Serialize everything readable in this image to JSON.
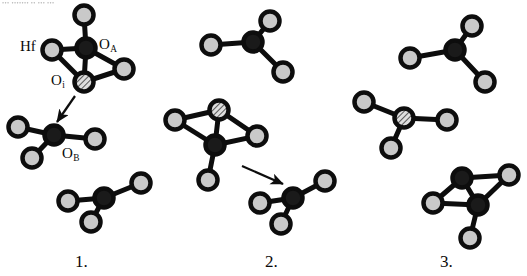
{
  "figure": {
    "top_cut_text": "••• ••••••• •• ••• •••",
    "background": "#ffffff",
    "atom_colors": {
      "ring": "#0d0d0d",
      "hafnium_fill": "#1a1a1a",
      "oxygen_fill": "#c9c9c9",
      "interstitial_hatch_fill": "#d7d7d7",
      "bond": "#0d0d0d"
    }
  },
  "labels": {
    "hf": {
      "text": "Hf",
      "sub": ""
    },
    "o_a": {
      "text": "O",
      "sub": "A"
    },
    "o_i": {
      "text": "O",
      "sub": "i"
    },
    "o_b": {
      "text": "O",
      "sub": "B"
    }
  },
  "panels": [
    {
      "id": "panel-1",
      "number": "1."
    },
    {
      "id": "panel-2",
      "number": "2."
    },
    {
      "id": "panel-3",
      "number": "3."
    }
  ],
  "chart_data": {
    "type": "diagram",
    "legend": [
      {
        "symbol": "dark-filled-circle",
        "name": "Hf",
        "fill": "#1a1a1a"
      },
      {
        "symbol": "light-filled-circle",
        "name": "O",
        "fill": "#c9c9c9"
      },
      {
        "symbol": "hatched-circle",
        "name": "O interstitial",
        "fill": "hatched"
      }
    ],
    "atom_radius_px": 9.5,
    "ring_width_px": 4.5,
    "bond_width_px": 5,
    "clusters": [
      {
        "panel": "1",
        "name": "panel1-upper-cluster",
        "atoms": [
          {
            "id": "p1a-hf-center",
            "type": "Hf",
            "x": 86,
            "y": 48
          },
          {
            "id": "p1a-o-top",
            "type": "O",
            "x": 84,
            "y": 15
          },
          {
            "id": "p1a-o-left",
            "type": "O",
            "x": 52,
            "y": 50
          },
          {
            "id": "p1a-o-right",
            "type": "O",
            "x": 124,
            "y": 69
          },
          {
            "id": "p1a-oi",
            "type": "Oi",
            "x": 84,
            "y": 82
          }
        ],
        "bonds": [
          [
            "p1a-hf-center",
            "p1a-o-top"
          ],
          [
            "p1a-hf-center",
            "p1a-o-left"
          ],
          [
            "p1a-hf-center",
            "p1a-o-right"
          ],
          [
            "p1a-hf-center",
            "p1a-oi"
          ],
          [
            "p1a-o-left",
            "p1a-oi"
          ],
          [
            "p1a-oi",
            "p1a-o-right"
          ]
        ],
        "labels": [
          {
            "ref": "hf",
            "x": 20,
            "y": 38
          },
          {
            "ref": "o_a",
            "x": 99,
            "y": 36
          },
          {
            "ref": "o_i",
            "x": 51,
            "y": 72
          }
        ]
      },
      {
        "panel": "1",
        "name": "panel1-lower-left-cluster",
        "atoms": [
          {
            "id": "p1b-hf",
            "type": "Hf",
            "x": 54,
            "y": 135
          },
          {
            "id": "p1b-o-left",
            "type": "O",
            "x": 18,
            "y": 127
          },
          {
            "id": "p1b-o-right",
            "type": "O",
            "x": 95,
            "y": 139
          },
          {
            "id": "p1b-o-down",
            "type": "O",
            "x": 32,
            "y": 158
          }
        ],
        "bonds": [
          [
            "p1b-hf",
            "p1b-o-left"
          ],
          [
            "p1b-hf",
            "p1b-o-right"
          ],
          [
            "p1b-hf",
            "p1b-o-down"
          ]
        ],
        "labels": [
          {
            "ref": "o_b",
            "x": 62,
            "y": 145
          }
        ]
      },
      {
        "panel": "1",
        "name": "panel1-lower-right-cluster",
        "atoms": [
          {
            "id": "p1c-hf",
            "type": "Hf",
            "x": 104,
            "y": 198
          },
          {
            "id": "p1c-o-left",
            "type": "O",
            "x": 68,
            "y": 201
          },
          {
            "id": "p1c-o-upper",
            "type": "O",
            "x": 141,
            "y": 183
          },
          {
            "id": "p1c-o-down",
            "type": "O",
            "x": 91,
            "y": 222
          }
        ],
        "bonds": [
          [
            "p1c-hf",
            "p1c-o-left"
          ],
          [
            "p1c-hf",
            "p1c-o-upper"
          ],
          [
            "p1c-hf",
            "p1c-o-down"
          ]
        ],
        "labels": []
      },
      {
        "panel": "2",
        "name": "panel2-upper-cluster",
        "atoms": [
          {
            "id": "p2a-hf",
            "type": "Hf",
            "x": 253,
            "y": 42
          },
          {
            "id": "p2a-o-left",
            "type": "O",
            "x": 211,
            "y": 45
          },
          {
            "id": "p2a-o-top",
            "type": "O",
            "x": 270,
            "y": 21
          },
          {
            "id": "p2a-o-down",
            "type": "O",
            "x": 283,
            "y": 72
          }
        ],
        "bonds": [
          [
            "p2a-hf",
            "p2a-o-left"
          ],
          [
            "p2a-hf",
            "p2a-o-top"
          ],
          [
            "p2a-hf",
            "p2a-o-down"
          ]
        ],
        "labels": []
      },
      {
        "panel": "2",
        "name": "panel2-middle-cluster",
        "atoms": [
          {
            "id": "p2b-hf",
            "type": "Hf",
            "x": 215,
            "y": 145
          },
          {
            "id": "p2b-oi",
            "type": "Oi",
            "x": 219,
            "y": 110
          },
          {
            "id": "p2b-o-left",
            "type": "O",
            "x": 175,
            "y": 120
          },
          {
            "id": "p2b-o-right",
            "type": "O",
            "x": 257,
            "y": 136
          },
          {
            "id": "p2b-o-down",
            "type": "O",
            "x": 208,
            "y": 180
          }
        ],
        "bonds": [
          [
            "p2b-hf",
            "p2b-oi"
          ],
          [
            "p2b-hf",
            "p2b-o-left"
          ],
          [
            "p2b-hf",
            "p2b-o-right"
          ],
          [
            "p2b-hf",
            "p2b-o-down"
          ],
          [
            "p2b-o-left",
            "p2b-oi"
          ],
          [
            "p2b-oi",
            "p2b-o-right"
          ]
        ],
        "labels": []
      },
      {
        "panel": "2",
        "name": "panel2-lower-cluster",
        "atoms": [
          {
            "id": "p2c-hf",
            "type": "Hf",
            "x": 293,
            "y": 198
          },
          {
            "id": "p2c-o-left",
            "type": "O",
            "x": 260,
            "y": 203
          },
          {
            "id": "p2c-o-upper",
            "type": "O",
            "x": 325,
            "y": 181
          },
          {
            "id": "p2c-o-down",
            "type": "O",
            "x": 281,
            "y": 224
          }
        ],
        "bonds": [
          [
            "p2c-hf",
            "p2c-o-left"
          ],
          [
            "p2c-hf",
            "p2c-o-upper"
          ],
          [
            "p2c-hf",
            "p2c-o-down"
          ]
        ],
        "labels": []
      },
      {
        "panel": "3",
        "name": "panel3-upper-cluster",
        "atoms": [
          {
            "id": "p3a-hf",
            "type": "Hf",
            "x": 455,
            "y": 50
          },
          {
            "id": "p3a-o-left",
            "type": "O",
            "x": 410,
            "y": 58
          },
          {
            "id": "p3a-o-top",
            "type": "O",
            "x": 472,
            "y": 26
          },
          {
            "id": "p3a-o-down",
            "type": "O",
            "x": 485,
            "y": 82
          }
        ],
        "bonds": [
          [
            "p3a-hf",
            "p3a-o-left"
          ],
          [
            "p3a-hf",
            "p3a-o-top"
          ],
          [
            "p3a-hf",
            "p3a-o-down"
          ]
        ],
        "labels": []
      },
      {
        "panel": "3",
        "name": "panel3-left-cluster",
        "atoms": [
          {
            "id": "p3b-oi",
            "type": "Oi",
            "x": 404,
            "y": 118
          },
          {
            "id": "p3b-o-upper",
            "type": "O",
            "x": 364,
            "y": 102
          },
          {
            "id": "p3b-o-right",
            "type": "O",
            "x": 447,
            "y": 120
          },
          {
            "id": "p3b-o-down",
            "type": "O",
            "x": 391,
            "y": 148
          }
        ],
        "bonds": [
          [
            "p3b-oi",
            "p3b-o-upper"
          ],
          [
            "p3b-oi",
            "p3b-o-right"
          ],
          [
            "p3b-oi",
            "p3b-o-down"
          ]
        ],
        "labels": []
      },
      {
        "panel": "3",
        "name": "panel3-dimer-cluster",
        "atoms": [
          {
            "id": "p3c-hf-top",
            "type": "Hf",
            "x": 462,
            "y": 178
          },
          {
            "id": "p3c-hf-bot",
            "type": "Hf",
            "x": 478,
            "y": 205
          },
          {
            "id": "p3c-o-right",
            "type": "O",
            "x": 509,
            "y": 175
          },
          {
            "id": "p3c-o-left",
            "type": "O",
            "x": 433,
            "y": 203
          },
          {
            "id": "p3c-o-down",
            "type": "O",
            "x": 470,
            "y": 238
          }
        ],
        "bonds": [
          [
            "p3c-hf-top",
            "p3c-hf-bot"
          ],
          [
            "p3c-hf-top",
            "p3c-o-right"
          ],
          [
            "p3c-hf-top",
            "p3c-o-left"
          ],
          [
            "p3c-hf-bot",
            "p3c-o-right"
          ],
          [
            "p3c-hf-bot",
            "p3c-o-left"
          ],
          [
            "p3c-hf-bot",
            "p3c-o-down"
          ]
        ],
        "labels": []
      }
    ],
    "arrows": [
      {
        "id": "arrow-panel-1",
        "panel": "1",
        "x1": 75,
        "y1": 96,
        "x2": 57,
        "y2": 122
      },
      {
        "id": "arrow-panel-2",
        "panel": "2",
        "x1": 242,
        "y1": 166,
        "x2": 283,
        "y2": 184
      }
    ],
    "panel_numbers": [
      {
        "id": "panel-num-1",
        "text": "1.",
        "x": 75,
        "y": 252
      },
      {
        "id": "panel-num-2",
        "text": "2.",
        "x": 265,
        "y": 252
      },
      {
        "id": "panel-num-3",
        "text": "3.",
        "x": 440,
        "y": 252
      }
    ]
  }
}
